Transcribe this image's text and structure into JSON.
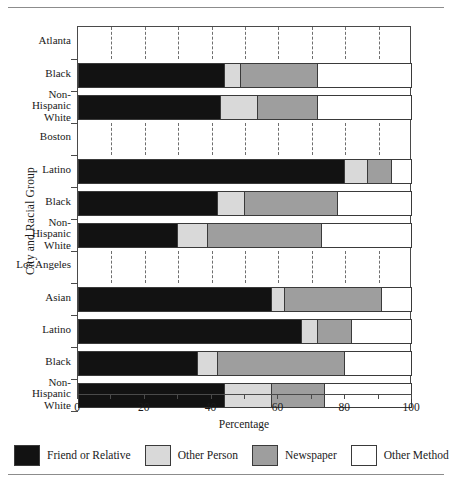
{
  "chart_data": {
    "type": "bar",
    "subtype": "stacked-horizontal-100",
    "title": "",
    "xlabel": "Percentage",
    "ylabel": "City and Racial Group",
    "xlim": [
      0,
      100
    ],
    "xticks": [
      0,
      20,
      40,
      60,
      80,
      100
    ],
    "xtick_labels": [
      "0",
      "20",
      "40",
      "60",
      "80",
      "100"
    ],
    "minor_tick_step": 10,
    "grid": "vertical dashed lines in group-header bands only",
    "legend_position": "bottom",
    "series": [
      {
        "name": "Friend or Relative",
        "color": "#121212",
        "values": [
          44,
          43,
          80,
          42,
          30,
          58,
          67,
          36,
          44
        ]
      },
      {
        "name": "Other Person",
        "color": "#d9d9d9",
        "values": [
          5,
          11,
          7,
          8,
          9,
          4,
          5,
          6,
          14
        ]
      },
      {
        "name": "Newspaper",
        "color": "#9e9e9e",
        "values": [
          23,
          18,
          7,
          28,
          34,
          29,
          10,
          38,
          16
        ]
      },
      {
        "name": "Other Method",
        "color": "#ffffff",
        "values": [
          28,
          28,
          6,
          22,
          27,
          9,
          18,
          20,
          26
        ]
      }
    ],
    "groups": [
      {
        "city": "Atlanta",
        "rows": [
          {
            "label": "Black",
            "lines": [
              "Black"
            ],
            "values": [
              44,
              5,
              23,
              28
            ]
          },
          {
            "label": "Non-Hispanic White",
            "lines": [
              "Non-",
              "Hispanic",
              "White"
            ],
            "values": [
              43,
              11,
              18,
              28
            ]
          }
        ]
      },
      {
        "city": "Boston",
        "rows": [
          {
            "label": "Latino",
            "lines": [
              "Latino"
            ],
            "values": [
              80,
              7,
              7,
              6
            ]
          },
          {
            "label": "Black",
            "lines": [
              "Black"
            ],
            "values": [
              42,
              8,
              28,
              22
            ]
          },
          {
            "label": "Non-Hispanic White",
            "lines": [
              "Non-",
              "Hispanic",
              "White"
            ],
            "values": [
              30,
              9,
              34,
              27
            ]
          }
        ]
      },
      {
        "city": "Los Angeles",
        "rows": [
          {
            "label": "Asian",
            "lines": [
              "Asian"
            ],
            "values": [
              58,
              4,
              29,
              9
            ]
          },
          {
            "label": "Latino",
            "lines": [
              "Latino"
            ],
            "values": [
              67,
              5,
              10,
              18
            ]
          },
          {
            "label": "Black",
            "lines": [
              "Black"
            ],
            "values": [
              36,
              6,
              38,
              20
            ]
          },
          {
            "label": "Non-Hispanic White",
            "lines": [
              "Non-",
              "Hispanic",
              "White"
            ],
            "values": [
              44,
              14,
              16,
              26
            ]
          }
        ]
      }
    ]
  },
  "legend": {
    "items": [
      {
        "label": "Friend or Relative",
        "swatch": "s0"
      },
      {
        "label": "Other Person",
        "swatch": "s1"
      },
      {
        "label": "Newspaper",
        "swatch": "s2"
      },
      {
        "label": "Other Method",
        "swatch": "s3"
      }
    ]
  },
  "axes": {
    "x_title": "Percentage",
    "y_title": "City and Racial Group",
    "x_tick_labels": [
      "0",
      "20",
      "40",
      "60",
      "80",
      "100"
    ]
  }
}
